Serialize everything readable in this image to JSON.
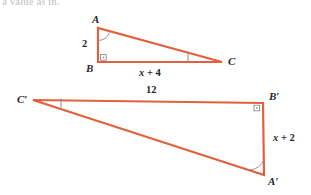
{
  "figure": {
    "header_text": "a value as in.",
    "stroke_color": "#e2603c",
    "mark_color": "#7f7f85",
    "label_color": "#26262a",
    "background_color": "#ffffff"
  },
  "triangle_1": {
    "name": "triangle-abc",
    "vertices": [
      {
        "label": "A",
        "x": 98,
        "y": 28,
        "label_x": 92,
        "label_y": 14
      },
      {
        "label": "B",
        "x": 98,
        "y": 62,
        "label_x": 86,
        "label_y": 63
      },
      {
        "label": "C",
        "x": 222,
        "y": 62,
        "label_x": 228,
        "label_y": 57
      }
    ],
    "sides": [
      {
        "name": "side-ab",
        "measure": "2",
        "label_x": 82,
        "label_y": 39
      },
      {
        "name": "side-bc",
        "measure": "x + 4",
        "label_x": 139,
        "label_y": 68
      }
    ],
    "right_angle_at": "B",
    "marked_angle_at": "A",
    "tick_on_side": "BC"
  },
  "triangle_2": {
    "name": "triangle-a-prime-b-prime-c-prime",
    "vertices": [
      {
        "label": "C′",
        "x": 33,
        "y": 100,
        "label_x": 17,
        "label_y": 95
      },
      {
        "label": "B′",
        "x": 263,
        "y": 103,
        "label_x": 269,
        "label_y": 91
      },
      {
        "label": "A′",
        "x": 264,
        "y": 175,
        "label_x": 268,
        "label_y": 176
      }
    ],
    "sides": [
      {
        "name": "side-c-prime-b-prime",
        "measure": "12",
        "label_x": 146,
        "label_y": 86
      },
      {
        "name": "side-b-prime-a-prime",
        "measure": "x + 2",
        "label_x": 273,
        "label_y": 133
      }
    ],
    "right_angle_at": "B′",
    "marked_angle_at": "A′",
    "tick_on_side": "C′B′"
  }
}
